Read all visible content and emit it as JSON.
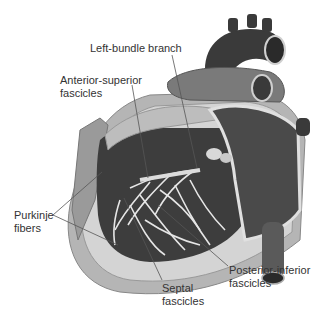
{
  "diagram": {
    "labels": {
      "left_bundle_branch": "Left-bundle branch",
      "anterior_superior_fascicles": "Anterior-superior\nfascicles",
      "purkinje_fibers": "Purkinje\nfibers",
      "septal_fascicles": "Septal\nfascicles",
      "posterior_inferior_fascicles": "Posterior-inferior\nfascicles"
    },
    "colors": {
      "background": "#ffffff",
      "text": "#333333",
      "leader_line": "#555555",
      "myocardium_dark": "#3a3a3a",
      "tissue_mid": "#8a8a8a",
      "tissue_light": "#c8c8c8",
      "conduction_fibers": "#e6e6e6"
    }
  }
}
